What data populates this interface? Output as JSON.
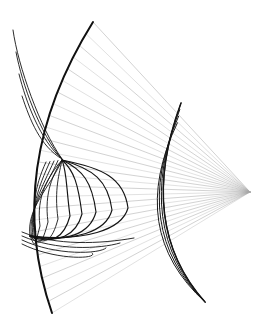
{
  "figure": {
    "type": "line-geometry-diagram",
    "width": 269,
    "height": 330,
    "background_color": "#ffffff",
    "stroke_color_dark": "#101010",
    "stroke_color_rays": "#9a9a9a",
    "stroke_color_rays_far": "#b4b4b4"
  },
  "chart_data": {
    "type": "line",
    "xlabel": "",
    "ylabel": "",
    "grid": false,
    "legend": null,
    "xlim": [
      0,
      269
    ],
    "ylim": [
      0,
      330
    ],
    "focus_point": {
      "x": 250,
      "y": 192
    },
    "ray_count": 26,
    "ray_fan": {
      "origin": {
        "x": 250,
        "y": 192
      },
      "spread_top": {
        "x": 93,
        "y": 22
      },
      "spread_bottom": {
        "x": 52,
        "y": 313
      },
      "note": "rays fan from focus at right toward the left arc"
    },
    "arcs": [
      {
        "name": "outer-mirror-arc",
        "start": {
          "x": 93,
          "y": 22
        },
        "control": {
          "x": 2,
          "y": 168
        },
        "end": {
          "x": 52,
          "y": 313
        },
        "stroke_width": 2.0
      },
      {
        "name": "inner-mirror-arc",
        "start": {
          "x": 181,
          "y": 103
        },
        "control": {
          "x": 136,
          "y": 225
        },
        "end": {
          "x": 205,
          "y": 302
        },
        "stroke_width": 1.5
      }
    ],
    "caustic_cusp": {
      "x": 62,
      "y": 160
    },
    "caustic_lower_node": {
      "x": 30,
      "y": 236
    },
    "caustic_loops": [
      {
        "index": 0,
        "tip_x": 128,
        "tip_y": 208,
        "top_y": 162,
        "bottom_y": 240
      },
      {
        "index": 1,
        "tip_x": 112,
        "tip_y": 210,
        "top_y": 163,
        "bottom_y": 240
      },
      {
        "index": 2,
        "tip_x": 96,
        "tip_y": 212,
        "top_y": 164,
        "bottom_y": 241
      },
      {
        "index": 3,
        "tip_x": 82,
        "tip_y": 214,
        "top_y": 165,
        "bottom_y": 242
      },
      {
        "index": 4,
        "tip_x": 70,
        "tip_y": 216,
        "top_y": 166,
        "bottom_y": 243
      },
      {
        "index": 5,
        "tip_x": 58,
        "tip_y": 219,
        "top_y": 167,
        "bottom_y": 244
      },
      {
        "index": 6,
        "tip_x": 48,
        "tip_y": 222,
        "top_y": 168,
        "bottom_y": 245
      },
      {
        "index": 7,
        "tip_x": 40,
        "tip_y": 226,
        "top_y": 170,
        "bottom_y": 246
      }
    ],
    "secondary_tail_curves": [
      {
        "index": 0,
        "offset": 0
      },
      {
        "index": 1,
        "offset": 3
      },
      {
        "index": 2,
        "offset": 6
      },
      {
        "index": 3,
        "offset": 9
      }
    ]
  }
}
